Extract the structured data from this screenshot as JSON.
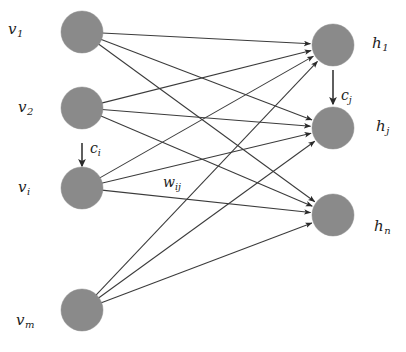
{
  "diagram": {
    "type": "bipartite-neural-network",
    "title": "",
    "background_color": "#ffffff",
    "node_fill_color": "#8a8a8a",
    "edge_color": "#3b3b3b",
    "label_color": "#1c1c1c",
    "node_radius": 21,
    "canvas": {
      "width": 406,
      "height": 352
    }
  },
  "visible_layer": {
    "name": "visible-units",
    "nodes": [
      {
        "id": "v1",
        "label": "v",
        "subscript": "1",
        "cx": 82,
        "cy": 32,
        "label_x": 8,
        "label_y": 22
      },
      {
        "id": "v2",
        "label": "v",
        "subscript": "2",
        "cx": 82,
        "cy": 108,
        "label_x": 18,
        "label_y": 100
      },
      {
        "id": "vi",
        "label": "v",
        "subscript": "i",
        "cx": 82,
        "cy": 188,
        "label_x": 18,
        "label_y": 180
      },
      {
        "id": "vm",
        "label": "v",
        "subscript": "m",
        "cx": 82,
        "cy": 310,
        "label_x": 16,
        "label_y": 313
      }
    ]
  },
  "hidden_layer": {
    "name": "hidden-units",
    "nodes": [
      {
        "id": "h1",
        "label": "h",
        "subscript": "1",
        "cx": 333,
        "cy": 45,
        "label_x": 372,
        "label_y": 36
      },
      {
        "id": "hj",
        "label": "h",
        "subscript": "j",
        "cx": 333,
        "cy": 128,
        "label_x": 376,
        "label_y": 119
      },
      {
        "id": "hn",
        "label": "h",
        "subscript": "n",
        "cx": 333,
        "cy": 215,
        "label_x": 374,
        "label_y": 219
      }
    ]
  },
  "bias_arrows": [
    {
      "id": "ci",
      "label": "c",
      "subscript": "i",
      "target": "vi",
      "x1": 82,
      "y1": 143,
      "x2": 82,
      "y2": 166,
      "label_x": 90,
      "label_y": 141
    },
    {
      "id": "cj",
      "label": "c",
      "subscript": "j",
      "target": "hj",
      "x1": 333,
      "y1": 70,
      "x2": 333,
      "y2": 104,
      "label_x": 341,
      "label_y": 88
    }
  ],
  "weight_label": {
    "id": "wij",
    "label": "w",
    "subscript": "ij",
    "label_x": 163,
    "label_y": 175
  },
  "connections": [
    {
      "from": "v1",
      "to": "h1"
    },
    {
      "from": "v1",
      "to": "hj"
    },
    {
      "from": "v1",
      "to": "hn"
    },
    {
      "from": "v2",
      "to": "h1"
    },
    {
      "from": "v2",
      "to": "hj"
    },
    {
      "from": "v2",
      "to": "hn"
    },
    {
      "from": "vi",
      "to": "h1"
    },
    {
      "from": "vi",
      "to": "hj"
    },
    {
      "from": "vi",
      "to": "hn"
    },
    {
      "from": "vm",
      "to": "h1"
    },
    {
      "from": "vm",
      "to": "hj"
    },
    {
      "from": "vm",
      "to": "hn"
    }
  ]
}
